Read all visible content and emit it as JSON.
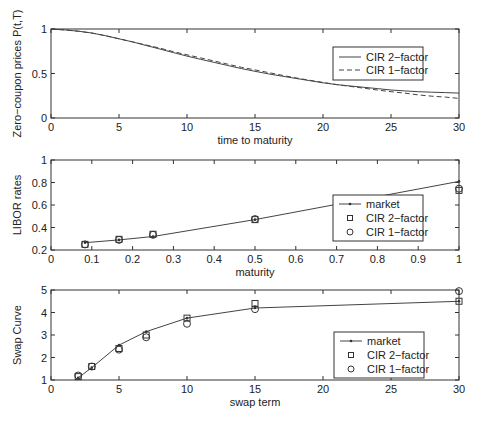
{
  "chart_data": [
    {
      "type": "line",
      "title": "",
      "xlabel": "time to maturity",
      "ylabel": "Zero−coupon prices P(t,T)",
      "xlim": [
        0,
        30
      ],
      "ylim": [
        0,
        1
      ],
      "xticks": [
        0,
        5,
        10,
        15,
        20,
        25,
        30
      ],
      "yticks": [
        0,
        0.5,
        1
      ],
      "ytick_labels": [
        "0",
        "0.5",
        "1"
      ],
      "grid": false,
      "legend_position": "upper right (inside)",
      "x": [
        0,
        1,
        2,
        3,
        4,
        5,
        6,
        7,
        8,
        9,
        10,
        11,
        12,
        13,
        14,
        15,
        16,
        17,
        18,
        19,
        20,
        21,
        22,
        23,
        24,
        25,
        26,
        27,
        28,
        29,
        30
      ],
      "series": [
        {
          "name": "CIR 2−factor",
          "style": "solid",
          "values": [
            1.0,
            0.99,
            0.975,
            0.955,
            0.925,
            0.89,
            0.855,
            0.815,
            0.775,
            0.735,
            0.695,
            0.66,
            0.625,
            0.59,
            0.555,
            0.525,
            0.495,
            0.47,
            0.445,
            0.42,
            0.395,
            0.375,
            0.36,
            0.345,
            0.33,
            0.315,
            0.305,
            0.295,
            0.29,
            0.285,
            0.28
          ]
        },
        {
          "name": "CIR 1−factor",
          "style": "dashed",
          "values": [
            1.0,
            0.99,
            0.975,
            0.955,
            0.925,
            0.89,
            0.855,
            0.82,
            0.785,
            0.745,
            0.71,
            0.675,
            0.64,
            0.605,
            0.57,
            0.54,
            0.51,
            0.48,
            0.45,
            0.425,
            0.4,
            0.375,
            0.355,
            0.335,
            0.315,
            0.295,
            0.28,
            0.26,
            0.245,
            0.235,
            0.22
          ]
        }
      ]
    },
    {
      "type": "scatter",
      "title": "",
      "xlabel": "maturity",
      "ylabel": "LIBOR rates",
      "xlim": [
        0,
        1
      ],
      "ylim": [
        0.2,
        1
      ],
      "xticks": [
        0,
        0.1,
        0.2,
        0.3,
        0.4,
        0.5,
        0.6,
        0.7,
        0.8,
        0.9,
        1
      ],
      "xtick_labels": [
        "0",
        "0.1",
        "0.2",
        "0.3",
        "0.4",
        "0.5",
        "0.6",
        "0.7",
        "0.8",
        "0.9",
        "1"
      ],
      "yticks": [
        0.2,
        0.4,
        0.6,
        0.8,
        1
      ],
      "ytick_labels": [
        "0.2",
        "0.4",
        "0.6",
        "0.8",
        "1"
      ],
      "grid": false,
      "legend_position": "lower right (inside)",
      "x": [
        0.0833,
        0.1667,
        0.25,
        0.5,
        1.0
      ],
      "series": [
        {
          "name": "market",
          "style": "line-dot",
          "values": [
            0.265,
            0.29,
            0.32,
            0.47,
            0.81
          ]
        },
        {
          "name": "CIR 2−factor",
          "style": "square",
          "values": [
            0.25,
            0.295,
            0.34,
            0.47,
            0.73
          ]
        },
        {
          "name": "CIR 1−factor",
          "style": "circle",
          "values": [
            0.25,
            0.29,
            0.335,
            0.475,
            0.745
          ]
        }
      ]
    },
    {
      "type": "scatter",
      "title": "",
      "xlabel": "swap term",
      "ylabel": "Swap Curve",
      "xlim": [
        0,
        30
      ],
      "ylim": [
        1,
        5
      ],
      "xticks": [
        0,
        5,
        10,
        15,
        20,
        25,
        30
      ],
      "yticks": [
        1,
        2,
        3,
        4,
        5
      ],
      "grid": false,
      "legend_position": "lower right (inside)",
      "x": [
        2,
        3,
        5,
        7,
        10,
        15,
        30
      ],
      "series": [
        {
          "name": "market",
          "style": "line-dot",
          "values": [
            1.1,
            1.55,
            2.55,
            3.15,
            3.75,
            4.2,
            4.5
          ]
        },
        {
          "name": "CIR 2−factor",
          "style": "square",
          "values": [
            1.15,
            1.6,
            2.4,
            3.0,
            3.75,
            4.4,
            4.5
          ]
        },
        {
          "name": "CIR 1−factor",
          "style": "circle",
          "values": [
            1.2,
            1.6,
            2.35,
            2.9,
            3.5,
            4.15,
            4.95
          ]
        }
      ]
    }
  ],
  "layout": {
    "panels": [
      {
        "left": 51,
        "right": 459,
        "top": 29,
        "bottom": 118,
        "legend": {
          "x": 333,
          "y": 47,
          "w": 90,
          "h": 33
        }
      },
      {
        "left": 51,
        "right": 459,
        "top": 160,
        "bottom": 250,
        "legend": {
          "x": 333,
          "y": 195,
          "w": 90,
          "h": 46
        }
      },
      {
        "left": 51,
        "right": 459,
        "top": 290,
        "bottom": 380,
        "legend": {
          "x": 334,
          "y": 332,
          "w": 90,
          "h": 46
        }
      }
    ],
    "colors": {
      "axis": "#333333",
      "line": "#444444",
      "marker": "#333333"
    }
  }
}
